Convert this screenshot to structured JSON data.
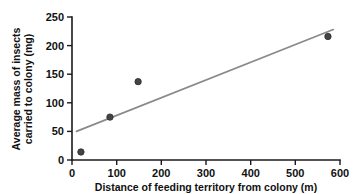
{
  "chart_data": {
    "type": "scatter",
    "title": "",
    "xlabel": "Distance of feeding territory from colony (m)",
    "ylabel_line1": "Average mass of insects",
    "ylabel_line2": "carried to colony (mg)",
    "xlim": [
      0,
      600
    ],
    "ylim": [
      0,
      250
    ],
    "xticks": [
      0,
      100,
      200,
      300,
      400,
      500,
      600
    ],
    "yticks": [
      0,
      50,
      100,
      150,
      200,
      250
    ],
    "xtick_labels": [
      "0",
      "100",
      "200",
      "300",
      "400",
      "500",
      "600"
    ],
    "ytick_labels": [
      "0",
      "50",
      "100",
      "150",
      "200",
      "250"
    ],
    "grid": false,
    "legend": false,
    "series": [
      {
        "name": "Average mass of insects carried to colony",
        "marker": "filled-circle",
        "color": "#444444",
        "points": [
          {
            "x": 20,
            "y": 14
          },
          {
            "x": 85,
            "y": 75
          },
          {
            "x": 148,
            "y": 137
          },
          {
            "x": 573,
            "y": 216
          }
        ]
      }
    ],
    "trend_line": {
      "name": "line of best fit",
      "color": "#8a8a8a",
      "x_start": 10,
      "y_start": 50,
      "x_end": 585,
      "y_end": 228
    }
  },
  "colors": {
    "marker": "#444444",
    "trend": "#8a8a8a",
    "axis": "#1a1a1a",
    "text": "#111111",
    "background": "#ffffff"
  }
}
